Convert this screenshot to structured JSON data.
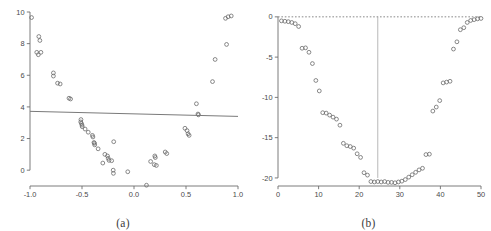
{
  "figure": {
    "panel_a_caption": "(a)",
    "panel_b_caption": "(b)"
  },
  "colors": {
    "point_stroke": "#6b6b6b",
    "axis": "#6e6e6e",
    "fit_line": "#7a7a7a",
    "reference_line": "#6b6b6b",
    "vertical_line": "#9a9a9a",
    "background": "#ffffff"
  },
  "chart_data": [
    {
      "type": "scatter",
      "panel": "(a)",
      "title": "",
      "xlabel": "",
      "ylabel": "",
      "xlim": [
        -1.0,
        1.0
      ],
      "ylim": [
        -1.0,
        10.0
      ],
      "grid": false,
      "legend": null,
      "xticks": [
        -1.0,
        -0.5,
        0.0,
        0.5,
        1.0
      ],
      "xtick_labels": [
        "-1.0",
        "-0.5",
        "0.0",
        "0.5",
        "1.0"
      ],
      "yticks": [
        0,
        2,
        4,
        6,
        8,
        10
      ],
      "ytick_labels": [
        "0",
        "2",
        "4",
        "6",
        "8",
        "10"
      ],
      "marker": "open-circle",
      "points": [
        [
          -0.985,
          9.65
        ],
        [
          -0.915,
          8.45
        ],
        [
          -0.905,
          8.2
        ],
        [
          -0.935,
          7.45
        ],
        [
          -0.92,
          7.3
        ],
        [
          -0.895,
          7.45
        ],
        [
          -0.775,
          6.15
        ],
        [
          -0.775,
          5.95
        ],
        [
          -0.735,
          5.5
        ],
        [
          -0.71,
          5.45
        ],
        [
          -0.625,
          4.55
        ],
        [
          -0.61,
          4.5
        ],
        [
          -0.51,
          3.2
        ],
        [
          -0.512,
          3.05
        ],
        [
          -0.505,
          2.95
        ],
        [
          -0.5,
          2.85
        ],
        [
          -0.498,
          2.75
        ],
        [
          -0.47,
          2.6
        ],
        [
          -0.44,
          2.4
        ],
        [
          -0.4,
          2.2
        ],
        [
          -0.395,
          2.1
        ],
        [
          -0.385,
          1.75
        ],
        [
          -0.38,
          1.7
        ],
        [
          -0.378,
          1.6
        ],
        [
          -0.345,
          1.35
        ],
        [
          -0.28,
          1.0
        ],
        [
          -0.255,
          0.9
        ],
        [
          -0.248,
          0.75
        ],
        [
          -0.24,
          0.62
        ],
        [
          -0.215,
          0.6
        ],
        [
          -0.3,
          0.45
        ],
        [
          -0.195,
          1.8
        ],
        [
          -0.2,
          0.0
        ],
        [
          -0.198,
          -0.2
        ],
        [
          -0.06,
          -0.1
        ],
        [
          0.12,
          -0.95
        ],
        [
          0.16,
          0.55
        ],
        [
          0.2,
          0.9
        ],
        [
          0.205,
          0.8
        ],
        [
          0.195,
          0.35
        ],
        [
          0.215,
          0.3
        ],
        [
          0.3,
          1.15
        ],
        [
          0.315,
          1.05
        ],
        [
          0.49,
          2.65
        ],
        [
          0.51,
          2.5
        ],
        [
          0.52,
          2.3
        ],
        [
          0.53,
          2.2
        ],
        [
          0.6,
          4.2
        ],
        [
          0.615,
          3.55
        ],
        [
          0.62,
          3.5
        ],
        [
          0.78,
          7.0
        ],
        [
          0.755,
          5.6
        ],
        [
          0.89,
          7.95
        ],
        [
          0.88,
          9.6
        ],
        [
          0.905,
          9.7
        ],
        [
          0.935,
          9.75
        ]
      ],
      "fit_line": {
        "label": "regression line",
        "x": [
          -1.0,
          1.0
        ],
        "y": [
          3.72,
          3.4
        ]
      }
    },
    {
      "type": "scatter",
      "panel": "(b)",
      "title": "",
      "xlabel": "",
      "ylabel": "",
      "xlim": [
        0,
        50
      ],
      "ylim": [
        -21.0,
        0.6
      ],
      "grid": false,
      "legend": null,
      "xticks": [
        0,
        10,
        20,
        30,
        40,
        50
      ],
      "xtick_labels": [
        "0",
        "10",
        "20",
        "30",
        "40",
        "50"
      ],
      "yticks": [
        0,
        -5,
        -10,
        -15,
        -20
      ],
      "ytick_labels": [
        "0",
        "-5",
        "-10",
        "-15",
        "-20"
      ],
      "marker": "open-circle",
      "points": [
        [
          1,
          -0.5
        ],
        [
          2,
          -0.55
        ],
        [
          3,
          -0.6
        ],
        [
          4,
          -0.7
        ],
        [
          5,
          -0.85
        ],
        [
          6,
          -1.2
        ],
        [
          7,
          -3.9
        ],
        [
          8,
          -3.85
        ],
        [
          9,
          -4.4
        ],
        [
          10,
          -5.8
        ],
        [
          11,
          -7.9
        ],
        [
          12,
          -9.2
        ],
        [
          13,
          -11.9
        ],
        [
          14,
          -11.95
        ],
        [
          15,
          -12.2
        ],
        [
          16,
          -12.45
        ],
        [
          17,
          -12.7
        ],
        [
          18,
          -13.45
        ],
        [
          19,
          -15.7
        ],
        [
          20,
          -16.0
        ],
        [
          21,
          -16.1
        ],
        [
          22,
          -16.3
        ],
        [
          23,
          -17.0
        ],
        [
          24,
          -17.45
        ],
        [
          25,
          -19.35
        ],
        [
          26,
          -19.65
        ],
        [
          27,
          -20.45
        ],
        [
          28,
          -20.5
        ],
        [
          29,
          -20.45
        ],
        [
          30,
          -20.5
        ],
        [
          31,
          -20.45
        ],
        [
          32,
          -20.55
        ],
        [
          33,
          -20.55
        ],
        [
          34,
          -20.6
        ],
        [
          35,
          -20.5
        ],
        [
          36,
          -20.4
        ],
        [
          37,
          -20.2
        ],
        [
          38,
          -19.9
        ],
        [
          39,
          -19.6
        ],
        [
          40,
          -19.3
        ],
        [
          41,
          -19.0
        ],
        [
          42,
          -18.8
        ],
        [
          43,
          -17.1
        ],
        [
          44,
          -17.05
        ],
        [
          45,
          -11.7
        ],
        [
          46,
          -11.2
        ],
        [
          47,
          -10.4
        ],
        [
          48,
          -8.2
        ],
        [
          49,
          -8.1
        ],
        [
          50,
          -8.0
        ],
        [
          51,
          -4.0
        ],
        [
          52,
          -3.1
        ],
        [
          53,
          -1.6
        ],
        [
          54,
          -1.35
        ],
        [
          55,
          -0.7
        ],
        [
          56,
          -0.45
        ],
        [
          57,
          -0.35
        ],
        [
          58,
          -0.25
        ],
        [
          59,
          -0.2
        ]
      ],
      "reference_line": {
        "label": "zero line",
        "orientation": "horizontal",
        "y": 0,
        "style": "dashed"
      },
      "vertical_line": {
        "label": "optimum marker",
        "orientation": "vertical",
        "x": 29,
        "style": "solid"
      }
    }
  ]
}
